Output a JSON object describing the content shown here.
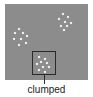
{
  "diagram": {
    "title": "clumped",
    "label": "clumped",
    "colors": {
      "field": "#8c8c8c",
      "dot": "#f4f4f4",
      "box": "#2a2a2a"
    },
    "clusters": [
      {
        "name": "top-right",
        "dots": [
          [
            62,
            13
          ],
          [
            67,
            16
          ],
          [
            58,
            18
          ],
          [
            64,
            21
          ],
          [
            70,
            22
          ],
          [
            60,
            25
          ],
          [
            66,
            25
          ],
          [
            63,
            29
          ]
        ]
      },
      {
        "name": "left",
        "dots": [
          [
            18,
            28
          ],
          [
            14,
            32
          ],
          [
            22,
            32
          ],
          [
            26,
            35
          ],
          [
            13,
            38
          ],
          [
            20,
            38
          ],
          [
            25,
            42
          ],
          [
            18,
            44
          ]
        ]
      },
      {
        "name": "bottom-highlighted",
        "dots": [
          [
            38,
            56
          ],
          [
            44,
            58
          ],
          [
            40,
            61
          ],
          [
            46,
            62
          ],
          [
            36,
            63
          ],
          [
            42,
            66
          ],
          [
            48,
            66
          ],
          [
            38,
            69
          ],
          [
            44,
            71
          ]
        ]
      }
    ]
  }
}
